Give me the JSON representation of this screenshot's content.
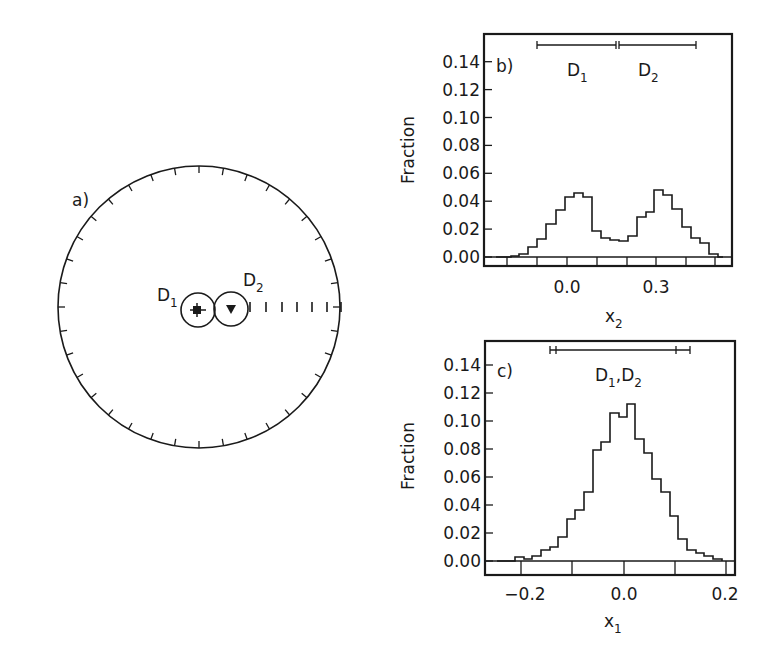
{
  "panels": {
    "a": {
      "label": "a)",
      "d1_label": "D",
      "d1_sub": "1",
      "d2_label": "D",
      "d2_sub": "2"
    },
    "b": {
      "label": "b)",
      "ylabel": "Fraction",
      "xlabel": "x",
      "xlabel_sub": "2",
      "yticks": [
        "0.14",
        "0.12",
        "0.10",
        "0.08",
        "0.06",
        "0.04",
        "0.02",
        "0.00"
      ],
      "xticks": [
        "0.0",
        "0.3"
      ],
      "d1_label": "D",
      "d1_sub": "1",
      "d2_label": "D",
      "d2_sub": "2"
    },
    "c": {
      "label": "c)",
      "ylabel": "Fraction",
      "xlabel": "x",
      "xlabel_sub": "1",
      "yticks": [
        "0.14",
        "0.12",
        "0.10",
        "0.08",
        "0.06",
        "0.04",
        "0.02",
        "0.00"
      ],
      "xticks": [
        "−0.2",
        "0.0",
        "0.2"
      ],
      "d_label": "D",
      "d_sub1": "1",
      "d_sep": ",",
      "d_sub2": "2"
    }
  },
  "chart_data": [
    {
      "type": "other",
      "title": "a) stereographic projection",
      "annotations": [
        "D1",
        "D2"
      ],
      "markers": [
        {
          "name": "D1",
          "symbol": "cross/square",
          "position": "near center"
        },
        {
          "name": "D2",
          "symbol": "triangle",
          "position": "right of D1"
        }
      ],
      "notes": "Circle with perimeter ticks; dashed scale marks to the right of D2 along horizontal radius"
    },
    {
      "type": "bar",
      "title": "b)",
      "xlabel": "x2",
      "ylabel": "Fraction",
      "ylim": [
        0,
        0.15
      ],
      "xticks": [
        0.0,
        0.3
      ],
      "bin_width": 0.03,
      "x": [
        -0.21,
        -0.18,
        -0.15,
        -0.12,
        -0.09,
        -0.06,
        -0.03,
        0.0,
        0.03,
        0.06,
        0.09,
        0.12,
        0.15,
        0.18,
        0.21,
        0.24,
        0.27,
        0.3,
        0.33,
        0.36,
        0.39,
        0.42,
        0.45,
        0.48
      ],
      "values": [
        0.0,
        0.001,
        0.002,
        0.004,
        0.012,
        0.024,
        0.047,
        0.071,
        0.08,
        0.083,
        0.078,
        0.047,
        0.026,
        0.023,
        0.022,
        0.029,
        0.057,
        0.067,
        0.096,
        0.087,
        0.071,
        0.043,
        0.021,
        0.012,
        0.005,
        0.001
      ],
      "intervals": [
        {
          "name": "D1",
          "range": [
            -0.11,
            0.17
          ]
        },
        {
          "name": "D2",
          "range": [
            0.17,
            0.45
          ]
        }
      ],
      "grid": false
    },
    {
      "type": "bar",
      "title": "c)",
      "xlabel": "x1",
      "ylabel": "Fraction",
      "ylim": [
        0,
        0.15
      ],
      "xticks": [
        -0.2,
        0.0,
        0.2
      ],
      "bin_width": 0.017,
      "values": [
        0.0,
        0.0,
        0.003,
        0.002,
        0.004,
        0.008,
        0.012,
        0.02,
        0.033,
        0.04,
        0.053,
        0.081,
        0.087,
        0.107,
        0.103,
        0.113,
        0.087,
        0.077,
        0.058,
        0.049,
        0.033,
        0.017,
        0.01,
        0.007,
        0.005,
        0.002,
        0.0
      ],
      "intervals": [
        {
          "name": "D1,D2",
          "range": [
            -0.15,
            0.13
          ]
        }
      ],
      "grid": false
    }
  ]
}
